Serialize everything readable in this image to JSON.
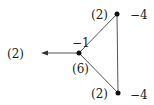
{
  "diagram": {
    "nodes": [
      {
        "id": "center",
        "label_above": "−1",
        "label_below": "(6)",
        "x": 79,
        "y": 53
      },
      {
        "id": "top",
        "label_left": "(2)",
        "label_right": "−4",
        "x": 117,
        "y": 14
      },
      {
        "id": "bottom",
        "label_left": "(2)",
        "label_right": "−4",
        "x": 118,
        "y": 93
      }
    ],
    "edges": [
      {
        "from": "center",
        "to": "top"
      },
      {
        "from": "center",
        "to": "bottom"
      },
      {
        "from": "top",
        "to": "bottom"
      }
    ],
    "arrow": {
      "from": "center",
      "label": "(2)"
    }
  }
}
